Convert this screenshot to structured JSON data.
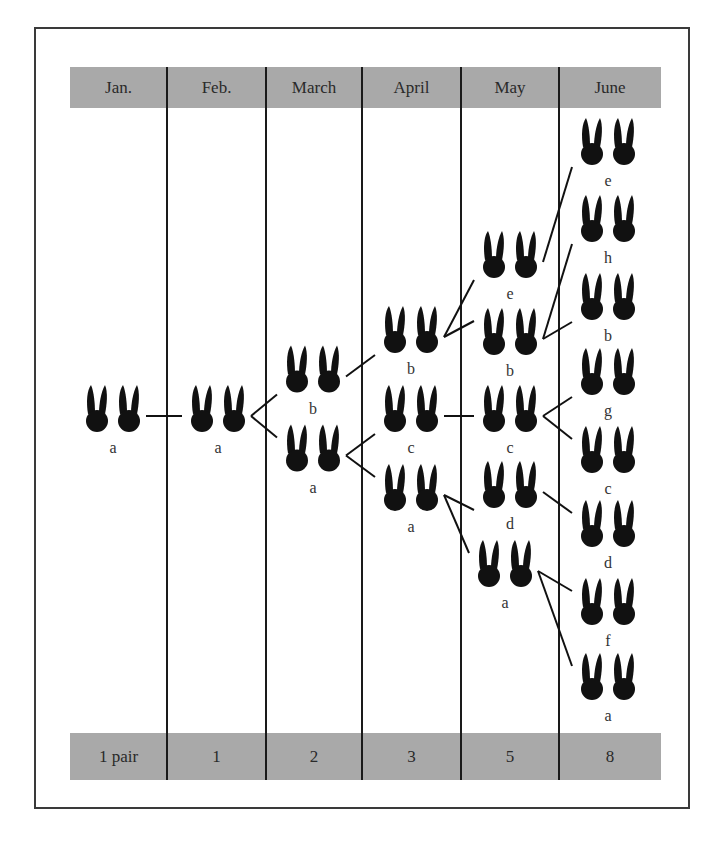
{
  "figure": {
    "header": [
      "Jan.",
      "Feb.",
      "March",
      "April",
      "May",
      "June"
    ],
    "footer": [
      "1 pair",
      "1",
      "2",
      "3",
      "5",
      "8"
    ],
    "icon": "rabbit-pair-icon",
    "ink_color": "#111111",
    "band_color": "#a9a9a9"
  },
  "pairs": [
    {
      "id": "jan-a",
      "month": 0,
      "label": "a",
      "row": 4
    },
    {
      "id": "feb-a",
      "month": 1,
      "label": "a",
      "row": 4
    },
    {
      "id": "mar-b",
      "month": 2,
      "label": "b",
      "row": 3
    },
    {
      "id": "mar-a",
      "month": 2,
      "label": "a",
      "row": 5
    },
    {
      "id": "apr-b",
      "month": 3,
      "label": "b",
      "row": 2
    },
    {
      "id": "apr-c",
      "month": 3,
      "label": "c",
      "row": 4
    },
    {
      "id": "apr-a",
      "month": 3,
      "label": "a",
      "row": 6
    },
    {
      "id": "may-e",
      "month": 4,
      "label": "e",
      "row": 0
    },
    {
      "id": "may-b",
      "month": 4,
      "label": "b",
      "row": 2
    },
    {
      "id": "may-c",
      "month": 4,
      "label": "c",
      "row": 4
    },
    {
      "id": "may-d",
      "month": 4,
      "label": "d",
      "row": 6
    },
    {
      "id": "may-a",
      "month": 4,
      "label": "a",
      "row": 8
    },
    {
      "id": "jun-e",
      "month": 5,
      "label": "e"
    },
    {
      "id": "jun-h",
      "month": 5,
      "label": "h"
    },
    {
      "id": "jun-b",
      "month": 5,
      "label": "b"
    },
    {
      "id": "jun-g",
      "month": 5,
      "label": "g"
    },
    {
      "id": "jun-c",
      "month": 5,
      "label": "c"
    },
    {
      "id": "jun-d",
      "month": 5,
      "label": "d"
    },
    {
      "id": "jun-f",
      "month": 5,
      "label": "f"
    },
    {
      "id": "jun-a",
      "month": 5,
      "label": "a"
    }
  ],
  "links": [
    [
      "jan-a",
      "feb-a"
    ],
    [
      "feb-a",
      "mar-b"
    ],
    [
      "feb-a",
      "mar-a"
    ],
    [
      "mar-b",
      "apr-b"
    ],
    [
      "mar-a",
      "apr-c"
    ],
    [
      "mar-a",
      "apr-a"
    ],
    [
      "apr-b",
      "may-e"
    ],
    [
      "apr-b",
      "may-b"
    ],
    [
      "apr-c",
      "may-c"
    ],
    [
      "apr-a",
      "may-d"
    ],
    [
      "apr-a",
      "may-a"
    ],
    [
      "may-e",
      "jun-e"
    ],
    [
      "may-b",
      "jun-h"
    ],
    [
      "may-b",
      "jun-b"
    ],
    [
      "may-c",
      "jun-g"
    ],
    [
      "may-c",
      "jun-c"
    ],
    [
      "may-d",
      "jun-d"
    ],
    [
      "may-a",
      "jun-f"
    ],
    [
      "may-a",
      "jun-a"
    ]
  ]
}
